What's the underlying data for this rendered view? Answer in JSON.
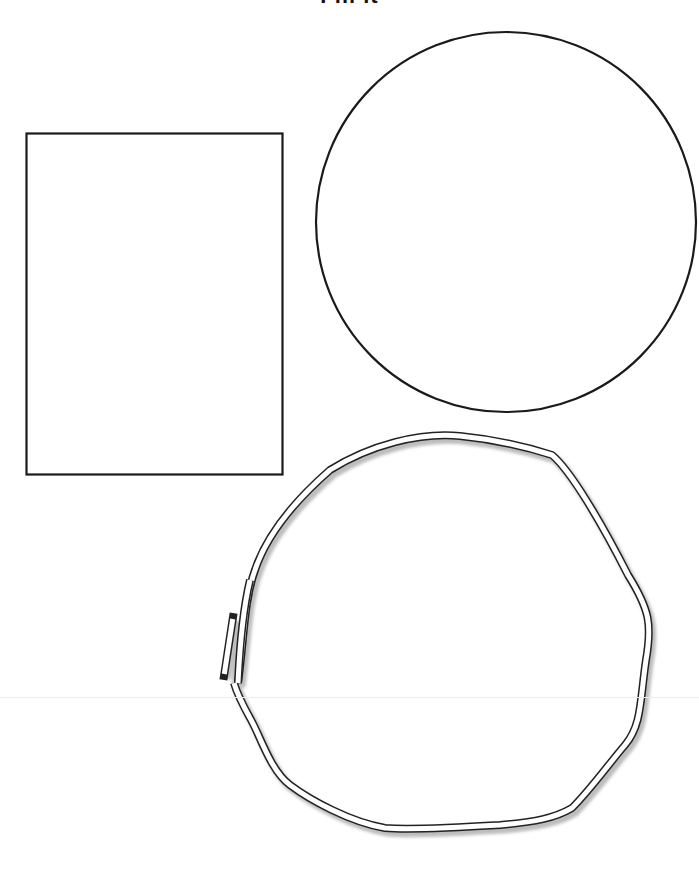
{
  "worksheet": {
    "title": "Fill it",
    "shapes": [
      {
        "name": "rectangle",
        "x": 26,
        "y": 133,
        "width": 257,
        "height": 342,
        "stroke": "#1a1a1a"
      },
      {
        "name": "circle",
        "cx": 506,
        "cy": 222,
        "r": 190,
        "stroke": "#1a1a1a"
      },
      {
        "name": "loop-rope",
        "stroke": "#222222",
        "fill": "#ffffff",
        "shadow": "#bdbdbd"
      }
    ],
    "colors": {
      "background": "#ffffff",
      "line": "#1a1a1a",
      "shadow": "#bdbdbd",
      "fold": "#ececec"
    }
  }
}
